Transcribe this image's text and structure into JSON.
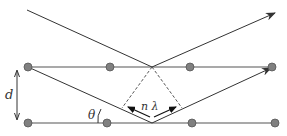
{
  "diagram": {
    "labels": {
      "spacing": "d",
      "angle": "θ",
      "path_difference": "n λ"
    },
    "colors": {
      "line": "#333333",
      "atom_fill": "#808080",
      "atom_stroke": "#555555",
      "dashed": "#555555"
    },
    "lattice_rows": [
      {
        "name": "top-plane",
        "y": 67,
        "atoms_x": [
          28,
          110,
          190,
          272
        ]
      },
      {
        "name": "bottom-plane",
        "y": 123,
        "atoms_x": [
          28,
          107,
          192,
          275
        ]
      }
    ]
  }
}
